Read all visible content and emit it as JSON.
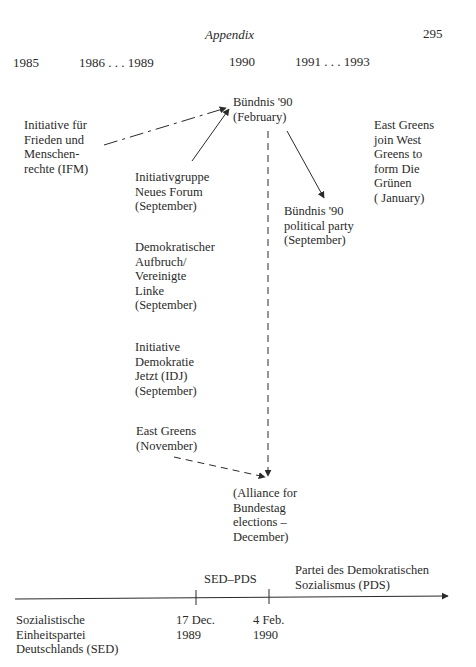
{
  "header": {
    "title": "Appendix",
    "page_number": "295"
  },
  "years": [
    {
      "label": "1985"
    },
    {
      "label": "1986 . . . 1989"
    },
    {
      "label": "1990"
    },
    {
      "label": "1991 . . . 1993"
    }
  ],
  "nodes": {
    "ifm": "Initiative für\nFrieden und\nMenschen-\nrechte (IFM)",
    "neues_forum": "Initiativgruppe\nNeues Forum\n(September)",
    "buendnis_feb": "Bündnis '90\n(February)",
    "buendnis_party": "Bündnis '90\npolitical party\n(September)",
    "east_greens_join": "East Greens\njoin West\nGreens to\nform Die\nGrünen\n( January)",
    "demokratischer_aufbruch": "Demokratischer\nAufbruch/\nVereinigte\nLinke\n(September)",
    "idj": "Initiative\nDemokratie\nJetzt (IDJ)\n(September)",
    "east_greens_nov": "East Greens\n(November)",
    "alliance": "(Alliance for\nBundestag\nelections –\nDecember)"
  },
  "timeline": {
    "sed_label": "Sozialistische\nEinheitspartei\nDeutschlands (SED)",
    "sed_pds_label": "SED–PDS",
    "pds_label": "Partei des Demokratischen\nSozialismus (PDS)",
    "tick1_label": "17 Dec.\n1989",
    "tick2_label": "4 Feb.\n1990"
  }
}
